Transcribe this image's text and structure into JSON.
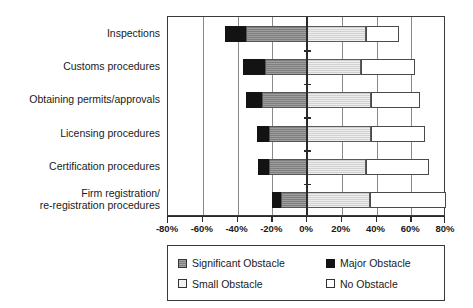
{
  "chart_data": {
    "type": "bar",
    "subtype": "diverging-stacked-horizontal",
    "title": "",
    "xlabel": "",
    "ylabel": "",
    "xlim": [
      -80,
      80
    ],
    "grid": true,
    "legend_position": "bottom",
    "xticks": [
      "-80%",
      "-60%",
      "-40%",
      "-20%",
      "0%",
      "20%",
      "40%",
      "60%",
      "80%"
    ],
    "xtick_values": [
      -80,
      -60,
      -40,
      -20,
      0,
      20,
      40,
      60,
      80
    ],
    "categories": [
      "Inspections",
      "Customs procedures",
      "Obtaining permits/approvals",
      "Licensing procedures",
      "Certification procedures",
      "Firm registration/\nre-registration procedures"
    ],
    "series": [
      {
        "name": "Major Obstacle",
        "key": "major",
        "color": "#131313",
        "side": "negative",
        "values": [
          -12,
          -13,
          -9,
          -7,
          -6,
          -5
        ]
      },
      {
        "name": "Significant Obstacle",
        "key": "significant",
        "color": "#8c8c8c",
        "side": "negative",
        "values": [
          -35,
          -24,
          -26,
          -22,
          -22,
          -15
        ]
      },
      {
        "name": "Small Obstacle",
        "key": "small",
        "color": "#dcdcdc",
        "side": "positive",
        "values": [
          34,
          31,
          37,
          37,
          34,
          36
        ]
      },
      {
        "name": "No Obstacle",
        "key": "none",
        "color": "#ffffff",
        "side": "positive",
        "values": [
          19,
          31,
          28,
          31,
          36,
          44
        ]
      }
    ],
    "rows": [
      {
        "category": "Inspections",
        "major": -12,
        "significant": -35,
        "small": 34,
        "none": 19,
        "neg_total": -47,
        "pos_total": 53
      },
      {
        "category": "Customs procedures",
        "major": -13,
        "significant": -24,
        "small": 31,
        "none": 31,
        "neg_total": -37,
        "pos_total": 62
      },
      {
        "category": "Obtaining permits/approvals",
        "major": -9,
        "significant": -26,
        "small": 37,
        "none": 28,
        "neg_total": -35,
        "pos_total": 65
      },
      {
        "category": "Licensing procedures",
        "major": -7,
        "significant": -22,
        "small": 37,
        "none": 31,
        "neg_total": -29,
        "pos_total": 68
      },
      {
        "category": "Certification procedures",
        "major": -6,
        "significant": -22,
        "small": 34,
        "none": 36,
        "neg_total": -28,
        "pos_total": 70
      },
      {
        "category": "Firm registration/re-registration procedures",
        "major": -5,
        "significant": -15,
        "small": 36,
        "none": 44,
        "neg_total": -20,
        "pos_total": 80
      }
    ]
  },
  "legend": {
    "items": [
      {
        "label": "Significant Obstacle",
        "key": "significant"
      },
      {
        "label": "Major Obstacle",
        "key": "major"
      },
      {
        "label": "Small Obstacle",
        "key": "small"
      },
      {
        "label": "No Obstacle",
        "key": "none"
      }
    ]
  }
}
